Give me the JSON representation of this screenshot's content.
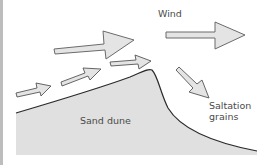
{
  "diagram": {
    "labels": {
      "wind": "Wind",
      "sand_dune": "Sand dune",
      "saltation_line1": "Saltation",
      "saltation_line2": "grains"
    },
    "colors": {
      "dune_fill": "#e0e0e0",
      "arrow_fill": "#e4e4e4",
      "arrow_stroke": "#6b6b6b",
      "outline": "#2a2a2a",
      "text": "#4a4a4a"
    },
    "elements": {
      "large_wind_arrows": 2,
      "surface_wind_arrows": 3,
      "saltation_arrows": 1
    }
  }
}
